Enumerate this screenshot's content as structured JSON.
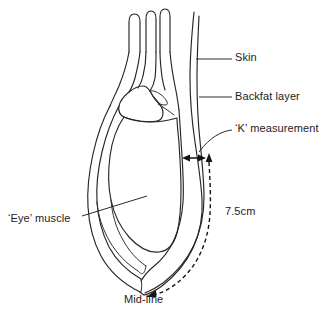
{
  "figure": {
    "type": "anatomical-line-diagram",
    "background_color": "#ffffff",
    "line_color": "#252525"
  },
  "labels": {
    "skin": "Skin",
    "backfat": "Backfat layer",
    "k_measurement": "‘K’ measurement",
    "eye_muscle": "‘Eye’ muscle",
    "distance": "7.5cm",
    "midline": "Mid-line"
  },
  "annotations": {
    "k_measurement_arrow": "double-headed horizontal arrow spanning backfat thickness",
    "distance_arrow": "dashed double-headed arrow along carcass edge",
    "leader_lines": 4
  }
}
